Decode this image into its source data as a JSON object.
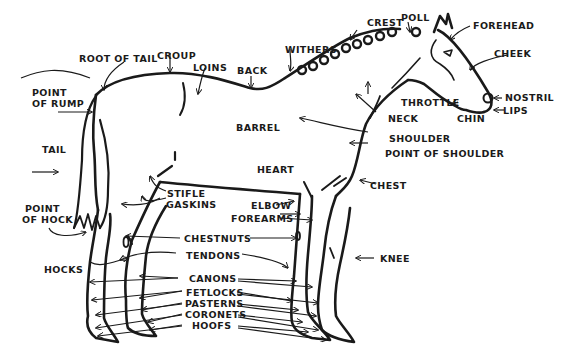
{
  "diagram": {
    "labels": {
      "crest": "CREST",
      "poll": "POLL",
      "forehead": "FOREHEAD",
      "withers": "WITHERS",
      "root_of_tail": "ROOT OF TAIL",
      "croup": "CROUP",
      "loins": "LOINS",
      "back": "BACK",
      "cheek": "CHEEK",
      "point_of_rump_1": "POINT",
      "point_of_rump_2": "OF RUMP",
      "nostril": "NOSTRIL",
      "throttle": "THROTTLE",
      "lips": "LIPS",
      "chin": "CHIN",
      "neck": "NECK",
      "barrel": "BARREL",
      "shoulder": "SHOULDER",
      "point_of_shoulder": "POINT OF SHOULDER",
      "tail": "TAIL",
      "heart": "HEART",
      "chest": "CHEST",
      "stifle": "STIFLE",
      "gaskins": "GASKINS",
      "elbow": "ELBOW",
      "forearms": "FOREARMS",
      "point_of_hock_1": "POINT",
      "point_of_hock_2": "OF HOCK",
      "chestnuts": "CHESTNUTS",
      "tendons": "TENDONS",
      "knee": "KNEE",
      "hocks": "HOCKS",
      "canons": "CANONS",
      "fetlocks": "FETLOCKS",
      "pasterns": "PASTERNS",
      "coronets": "CORONETS",
      "hoofs": "HOOFS"
    },
    "colors": {
      "ink": "#1a1a1a",
      "paper": "#ffffff"
    }
  }
}
